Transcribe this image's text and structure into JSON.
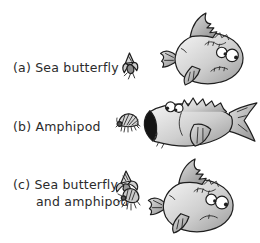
{
  "figure": {
    "rows": [
      {
        "label_line1": "(a) Sea butterfly",
        "label_line2": "",
        "prey_icon": "sea-butterfly-icon",
        "fish_icon": "fish-turning-away-icon"
      },
      {
        "label_line1": "(b) Amphipod",
        "label_line2": "",
        "prey_icon": "amphipod-icon",
        "fish_icon": "fish-mouth-open-icon"
      },
      {
        "label_line1": "(c) Sea butterfly",
        "label_line2": "and amphipod",
        "prey_icon": "sea-butterfly-and-amphipod-icon",
        "fish_icon": "fish-turning-away-icon"
      }
    ],
    "colors": {
      "background": "#ffffff",
      "text": "#2b2b2b",
      "outline": "#1e1e1e",
      "fish_body_light": "#f5f5f5",
      "fish_body_dark": "#9b9b9b",
      "fin_light": "#e0e0e0",
      "fin_dark": "#8f8f8f",
      "mouth_interior": "#141414"
    }
  }
}
